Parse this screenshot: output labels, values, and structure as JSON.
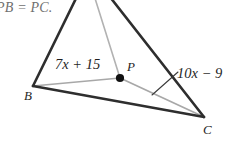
{
  "figure": {
    "given_text": "PB = PC.",
    "vertices": [
      {
        "name": "B",
        "label": "B"
      },
      {
        "name": "C",
        "label": "C"
      },
      {
        "name": "P",
        "label": "P"
      }
    ],
    "segment_labels": {
      "pb": "7x + 15",
      "pc": "10x − 9"
    },
    "colors": {
      "triangle_side": "#2e2e2e",
      "cevian": "#a8a8a8",
      "point": "#111111",
      "given_text": "#6f6f6f",
      "label_text": "#1f1f1f",
      "background": "#ffffff"
    }
  }
}
